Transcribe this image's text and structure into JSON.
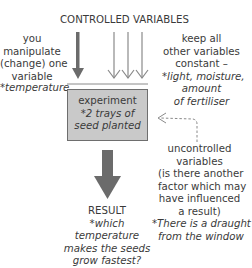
{
  "diagram": {
    "top_label": "CONTROLLED VARIABLES",
    "left_note": {
      "lines": [
        "you",
        "manipulate",
        "(change) one",
        "variable"
      ],
      "example": "*temperature"
    },
    "right_note": {
      "lines": [
        "keep all",
        "other variables",
        "constant –"
      ],
      "example_lines": [
        "*light, moisture,",
        "amount",
        "of fertiliser"
      ]
    },
    "experiment_box": {
      "title": "experiment",
      "example_lines": [
        "*2 trays of",
        "seed planted"
      ],
      "fill_color": "#c9c9c9"
    },
    "uncontrolled_note": {
      "lines": [
        "uncontrolled",
        "variables",
        "(is there another",
        "factor which may",
        "have influenced",
        "a result)"
      ],
      "example_lines": [
        "*There is a draught",
        "from the window"
      ]
    },
    "result_note": {
      "title": "RESULT",
      "example_lines": [
        "*which",
        "temperature",
        "makes the seeds",
        "grow fastest?"
      ]
    },
    "arrow_color": "#6b6b6b"
  }
}
